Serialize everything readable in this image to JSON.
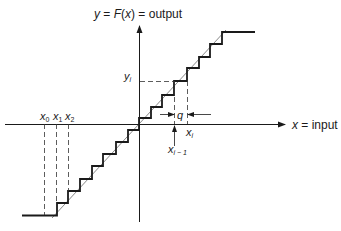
{
  "diagram": {
    "type": "quantizer staircase transfer characteristic",
    "y_axis_label": {
      "var": "y",
      "eq1": " = ",
      "fn": "F",
      "open": "(",
      "arg": "x",
      "close": ")",
      "eq2": " = output"
    },
    "x_axis_label": {
      "var": "x",
      "rest": " = input"
    },
    "labels": {
      "x0": {
        "base": "x",
        "sub": "0"
      },
      "x1": {
        "base": "x",
        "sub": "1"
      },
      "x2": {
        "base": "x",
        "sub": "2"
      },
      "yi": {
        "base": "y",
        "sub": "i"
      },
      "xi": {
        "base": "x",
        "sub": "i"
      },
      "xi_minus_1": {
        "base": "x",
        "sub": "i − 1"
      },
      "q": "q"
    },
    "colors": {
      "line": "#1a1a1a",
      "dashed": "#333333"
    }
  }
}
